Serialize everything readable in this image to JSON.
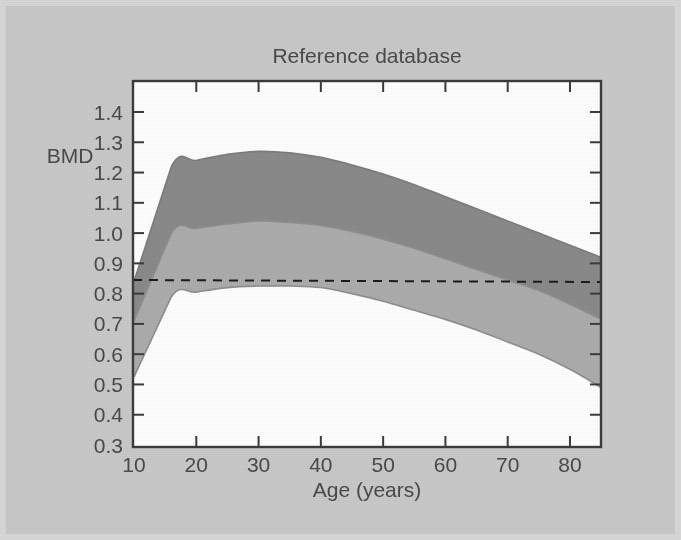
{
  "figure": {
    "background_color": "#c9c9c9",
    "plot_background_color": "#ffffff",
    "frame_color": "#3c3c3c",
    "text_color": "#4a4a4a"
  },
  "chart_data": {
    "type": "area",
    "title": "Reference database",
    "xlabel": "Age (years)",
    "ylabel": "BMD",
    "xlim": [
      10,
      85
    ],
    "ylim": [
      0.3,
      1.45
    ],
    "grid": false,
    "legend": null,
    "xticks": [
      10,
      20,
      30,
      40,
      50,
      60,
      70,
      80
    ],
    "xtick_labels": [
      "10",
      "20",
      "30",
      "40",
      "50",
      "60",
      "70",
      "80"
    ],
    "yticks": [
      0.3,
      0.4,
      0.5,
      0.6,
      0.7,
      0.8,
      0.9,
      1.0,
      1.1,
      1.2,
      1.3,
      1.4
    ],
    "ytick_labels": [
      "0.3",
      "0.4",
      "0.5",
      "0.6",
      "0.7",
      "0.8",
      "0.9",
      "1.0",
      "1.1",
      "1.2",
      "1.3",
      "1.4"
    ],
    "x": [
      10,
      16,
      20,
      25,
      30,
      35,
      40,
      45,
      50,
      55,
      60,
      65,
      70,
      75,
      80,
      85
    ],
    "series": [
      {
        "name": "upper-band-top",
        "role": "upper bound (+2 SD)",
        "color": "#8a8a8a",
        "values": [
          0.84,
          1.22,
          1.24,
          1.26,
          1.27,
          1.265,
          1.25,
          1.225,
          1.195,
          1.16,
          1.12,
          1.08,
          1.04,
          1.0,
          0.96,
          0.92
        ]
      },
      {
        "name": "mean-line",
        "role": "mean (reference mean)",
        "color": "#8a8a8a",
        "values": [
          0.71,
          1.0,
          1.015,
          1.03,
          1.04,
          1.035,
          1.025,
          1.005,
          0.98,
          0.95,
          0.915,
          0.88,
          0.845,
          0.81,
          0.765,
          0.715
        ]
      },
      {
        "name": "lower-band-bottom",
        "role": "lower bound (-2 SD)",
        "color": "#8a8a8a",
        "values": [
          0.525,
          0.79,
          0.805,
          0.82,
          0.825,
          0.825,
          0.82,
          0.8,
          0.775,
          0.745,
          0.715,
          0.68,
          0.64,
          0.6,
          0.55,
          0.49
        ]
      }
    ],
    "bands": [
      {
        "name": "upper-band",
        "label": "mean to +2 SD",
        "fill": "#8a8a8a",
        "upper_series": "upper-band-top",
        "lower_series": "mean-line"
      },
      {
        "name": "lower-band",
        "label": "-2 SD to mean",
        "fill": "#adadad",
        "upper_series": "mean-line",
        "lower_series": "lower-band-bottom"
      }
    ],
    "annotations": [
      {
        "name": "fracture-threshold",
        "type": "horizontal-dashed-line",
        "value": 0.845,
        "color": "#1c1c1c",
        "style": "dashed",
        "label": ""
      }
    ]
  }
}
